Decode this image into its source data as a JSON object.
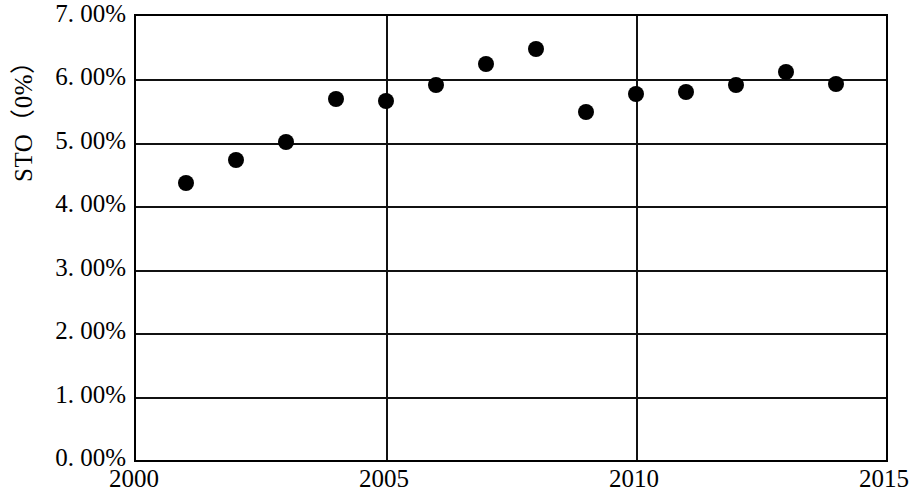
{
  "chart_data": {
    "type": "scatter",
    "title": "",
    "subtitle": "",
    "xlabel": "",
    "ylabel": "STO（0%）",
    "x": [
      2001,
      2002,
      2003,
      2004,
      2005,
      2006,
      2007,
      2008,
      2009,
      2010,
      2011,
      2012,
      2013,
      2014
    ],
    "values": [
      4.37,
      4.73,
      5.02,
      5.69,
      5.66,
      5.91,
      6.24,
      6.48,
      5.49,
      5.77,
      5.8,
      5.91,
      6.12,
      5.93
    ],
    "series": [
      {
        "name": "STO",
        "values": [
          4.37,
          4.73,
          5.02,
          5.69,
          5.66,
          5.91,
          6.24,
          6.48,
          5.49,
          5.77,
          5.8,
          5.91,
          6.12,
          5.93
        ]
      }
    ],
    "xlim": [
      2000,
      2015
    ],
    "ylim": [
      0,
      7
    ],
    "grid": true,
    "legend": false,
    "legend_position": "none",
    "marker": "filled-circle",
    "marker_color": "#000000",
    "x_ticks": [
      2000,
      2005,
      2010,
      2015
    ],
    "x_tick_labels": [
      "2000",
      "2005",
      "2010",
      "2015"
    ],
    "y_ticks": [
      0,
      1,
      2,
      3,
      4,
      5,
      6,
      7
    ],
    "y_tick_labels": [
      "0. 00%",
      "1. 00%",
      "2. 00%",
      "3. 00%",
      "4. 00%",
      "5. 00%",
      "6. 00%",
      "7. 00%"
    ]
  },
  "axes": {
    "y_title": "STO（0%）"
  },
  "colors": {
    "axis": "#000000",
    "grid": "#111111",
    "marker": "#000000",
    "background": "#ffffff"
  }
}
